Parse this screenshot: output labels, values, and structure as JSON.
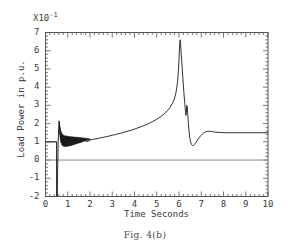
{
  "figure": {
    "caption": "Fig. 4(b)",
    "exponent_prefix": "X10",
    "exponent_power": "-1"
  },
  "axes": {
    "ylabel": "Load Power in p.u.",
    "xlabel": "Time  Seconds",
    "y_ticks": [
      "7",
      "6",
      "5",
      "4",
      "3",
      "2",
      "1",
      "0",
      "-1",
      "-2"
    ],
    "x_ticks": [
      "0",
      "1",
      "2",
      "3",
      "4",
      "5",
      "6",
      "7",
      "8",
      "9",
      "10"
    ]
  },
  "colors": {
    "curve": "#1a1a1a",
    "zero_line": "#8a8a8a",
    "prefault": "#8a8a8a",
    "frame": "#555555",
    "background": "#ffffff"
  },
  "chart_data": {
    "type": "line",
    "title": "Fig. 4(b)",
    "subtitle": "",
    "xlabel": "Time  Seconds",
    "ylabel": "Load Power in p.u.",
    "y_scale_note": "values in units of X10^-1 p.u.",
    "xlim": [
      0,
      10
    ],
    "ylim": [
      -2,
      7
    ],
    "x_major_tick": 1,
    "x_minor_tick": 0.2,
    "y_major_tick": 1,
    "y_minor_tick": 0.2,
    "grid": false,
    "legend": "none",
    "annotations": [
      {
        "text": "X10^-1",
        "position": "above y-axis"
      }
    ],
    "reference_lines": [
      {
        "name": "zero-line",
        "y": 0,
        "color": "#8a8a8a"
      },
      {
        "name": "prefault-level",
        "y": 1.0,
        "from_x": 0,
        "to_x": 0.5,
        "color": "#8a8a8a"
      }
    ],
    "features": {
      "prefault_value": 1.0,
      "fault_time": 0.5,
      "fault_dip_min": -2.0,
      "first_spike_peak": 2.15,
      "oscillation_band_end": 2.0,
      "ramp_start_value": 1.15,
      "main_peak_time": 6.05,
      "main_peak_value": 6.6,
      "secondary_bump_time": 6.35,
      "secondary_bump_value": 3.0,
      "post_peak_dip_time": 6.65,
      "post_peak_dip_value": 0.8,
      "settling_value": 1.5,
      "settling_time": 7.5
    },
    "series": [
      {
        "name": "Load Power",
        "color": "#1a1a1a",
        "points": [
          [
            0.0,
            1.0
          ],
          [
            0.49,
            1.0
          ],
          [
            0.5,
            1.0
          ],
          [
            0.5,
            -2.0
          ],
          [
            0.53,
            -2.0
          ],
          [
            0.55,
            -0.3
          ],
          [
            0.57,
            1.0
          ],
          [
            0.59,
            1.7
          ],
          [
            0.61,
            2.15
          ],
          [
            0.63,
            1.9
          ],
          [
            0.66,
            1.5
          ],
          [
            0.7,
            1.2
          ],
          [
            0.75,
            1.05
          ],
          [
            0.8,
            1.0
          ],
          [
            0.85,
            1.06
          ],
          [
            0.9,
            1.15
          ],
          [
            0.95,
            1.2
          ],
          [
            1.0,
            1.18
          ],
          [
            1.05,
            1.08
          ],
          [
            1.1,
            0.98
          ],
          [
            1.15,
            0.92
          ],
          [
            1.2,
            0.94
          ],
          [
            1.25,
            1.02
          ],
          [
            1.3,
            1.1
          ],
          [
            1.35,
            1.14
          ],
          [
            1.4,
            1.12
          ],
          [
            1.45,
            1.04
          ],
          [
            1.5,
            0.98
          ],
          [
            1.55,
            0.96
          ],
          [
            1.6,
            1.0
          ],
          [
            1.65,
            1.06
          ],
          [
            1.7,
            1.1
          ],
          [
            1.75,
            1.1
          ],
          [
            1.8,
            1.06
          ],
          [
            1.85,
            1.02
          ],
          [
            1.9,
            1.02
          ],
          [
            1.95,
            1.06
          ],
          [
            2.0,
            1.1
          ],
          [
            2.1,
            1.13
          ],
          [
            2.2,
            1.15
          ],
          [
            2.4,
            1.2
          ],
          [
            2.6,
            1.25
          ],
          [
            2.8,
            1.3
          ],
          [
            3.0,
            1.36
          ],
          [
            3.2,
            1.42
          ],
          [
            3.4,
            1.48
          ],
          [
            3.6,
            1.55
          ],
          [
            3.8,
            1.62
          ],
          [
            4.0,
            1.7
          ],
          [
            4.2,
            1.79
          ],
          [
            4.4,
            1.88
          ],
          [
            4.6,
            1.98
          ],
          [
            4.8,
            2.1
          ],
          [
            5.0,
            2.24
          ],
          [
            5.2,
            2.4
          ],
          [
            5.35,
            2.55
          ],
          [
            5.5,
            2.74
          ],
          [
            5.6,
            2.9
          ],
          [
            5.7,
            3.1
          ],
          [
            5.78,
            3.32
          ],
          [
            5.85,
            3.62
          ],
          [
            5.9,
            3.95
          ],
          [
            5.94,
            4.35
          ],
          [
            5.97,
            4.85
          ],
          [
            6.0,
            5.5
          ],
          [
            6.02,
            6.1
          ],
          [
            6.04,
            6.5
          ],
          [
            6.05,
            6.6
          ],
          [
            6.07,
            6.4
          ],
          [
            6.1,
            5.8
          ],
          [
            6.14,
            5.1
          ],
          [
            6.18,
            4.4
          ],
          [
            6.22,
            3.7
          ],
          [
            6.26,
            3.1
          ],
          [
            6.29,
            2.7
          ],
          [
            6.31,
            2.45
          ],
          [
            6.33,
            2.6
          ],
          [
            6.35,
            3.0
          ],
          [
            6.37,
            2.95
          ],
          [
            6.39,
            2.55
          ],
          [
            6.42,
            2.05
          ],
          [
            6.45,
            1.6
          ],
          [
            6.48,
            1.25
          ],
          [
            6.52,
            1.0
          ],
          [
            6.56,
            0.86
          ],
          [
            6.6,
            0.8
          ],
          [
            6.65,
            0.8
          ],
          [
            6.7,
            0.86
          ],
          [
            6.76,
            0.96
          ],
          [
            6.82,
            1.08
          ],
          [
            6.9,
            1.22
          ],
          [
            6.98,
            1.34
          ],
          [
            7.06,
            1.44
          ],
          [
            7.14,
            1.51
          ],
          [
            7.22,
            1.56
          ],
          [
            7.3,
            1.58
          ],
          [
            7.4,
            1.58
          ],
          [
            7.5,
            1.56
          ],
          [
            7.6,
            1.54
          ],
          [
            7.75,
            1.52
          ],
          [
            7.9,
            1.51
          ],
          [
            8.1,
            1.5
          ],
          [
            8.4,
            1.5
          ],
          [
            9.0,
            1.5
          ],
          [
            9.5,
            1.5
          ],
          [
            10.0,
            1.5
          ]
        ]
      }
    ],
    "oscillation_band": {
      "name": "dense decaying oscillation envelope",
      "description": "solid filled band between upper and lower envelope from t=0.62 to t=2.0",
      "upper": [
        [
          0.62,
          2.05
        ],
        [
          0.68,
          1.62
        ],
        [
          0.75,
          1.42
        ],
        [
          0.85,
          1.34
        ],
        [
          1.0,
          1.3
        ],
        [
          1.15,
          1.28
        ],
        [
          1.3,
          1.26
        ],
        [
          1.5,
          1.24
        ],
        [
          1.7,
          1.21
        ],
        [
          1.85,
          1.18
        ],
        [
          2.0,
          1.16
        ]
      ],
      "lower": [
        [
          0.62,
          1.55
        ],
        [
          0.68,
          1.0
        ],
        [
          0.75,
          0.8
        ],
        [
          0.85,
          0.74
        ],
        [
          1.0,
          0.76
        ],
        [
          1.15,
          0.8
        ],
        [
          1.3,
          0.86
        ],
        [
          1.5,
          0.94
        ],
        [
          1.7,
          1.02
        ],
        [
          1.85,
          1.08
        ],
        [
          2.0,
          1.12
        ]
      ]
    }
  }
}
